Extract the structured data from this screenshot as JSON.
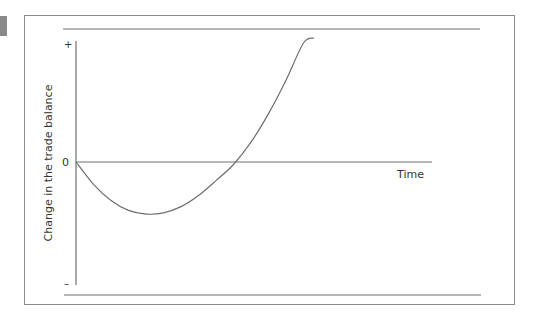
{
  "chart_data": {
    "type": "line",
    "title": "",
    "xlabel": "Time",
    "ylabel": "Change in the trade balance",
    "y_tick_labels": {
      "top": "+",
      "zero": "0",
      "bottom": "–"
    },
    "x_range": [
      0,
      10
    ],
    "ylim": [
      -1,
      1
    ],
    "grid": false,
    "legend": "none",
    "series": [
      {
        "name": "J-curve",
        "color": "#6e6e6e",
        "x": [
          0,
          0.5,
          1,
          1.5,
          2,
          2.5,
          3,
          3.5,
          4,
          4.5,
          5,
          5.5,
          6,
          6.5,
          6.8
        ],
        "y": [
          0,
          -0.18,
          -0.31,
          -0.39,
          -0.42,
          -0.41,
          -0.36,
          -0.27,
          -0.15,
          -0.02,
          0.16,
          0.39,
          0.66,
          0.96,
          1.0
        ]
      }
    ],
    "curve_description": "Trade balance worsens initially after depreciation, reaches a trough, then rises above zero and keeps improving"
  },
  "colors": {
    "axis": "#6e6e6e",
    "frame": "#8c8c8c",
    "text": "#333333"
  }
}
